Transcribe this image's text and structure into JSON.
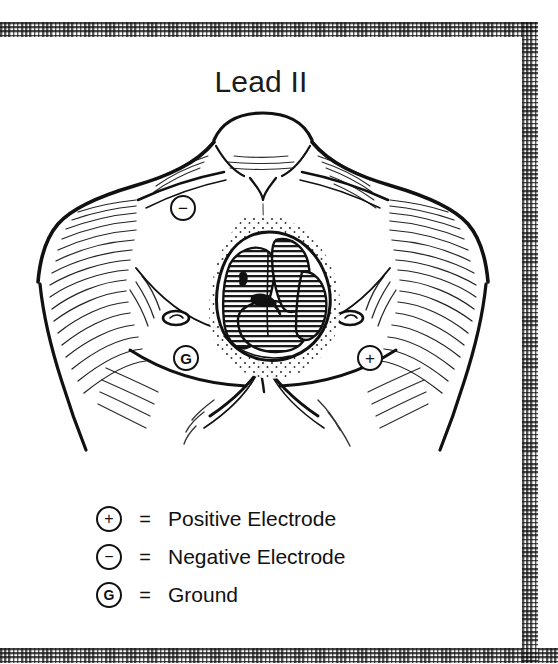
{
  "figure": {
    "title": "Lead II",
    "clipped_header_text": ""
  },
  "electrodes": [
    {
      "id": "negative",
      "symbol": "−",
      "name": "negative-electrode-marker",
      "placement": "right infraclavicular / right upper chest"
    },
    {
      "id": "ground",
      "symbol": "G",
      "name": "ground-electrode-marker",
      "placement": "right lower chest"
    },
    {
      "id": "positive",
      "symbol": "+",
      "name": "positive-electrode-marker",
      "placement": "left lower chest"
    }
  ],
  "legend": {
    "equals": "=",
    "rows": [
      {
        "symbol": "+",
        "label": "Positive Electrode"
      },
      {
        "symbol": "−",
        "label": "Negative Electrode"
      },
      {
        "symbol": "G",
        "label": "Ground"
      }
    ]
  },
  "colors": {
    "ink": "#111111",
    "paper": "#ffffff",
    "border_dark": "#4a4a4a",
    "border_light": "#b9b9b9",
    "heart_hatch": "#1a1a1a"
  }
}
